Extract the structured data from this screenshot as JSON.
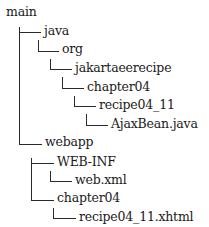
{
  "tree": {
    "root": "main",
    "nodes": [
      {
        "label": "java",
        "depth": 1
      },
      {
        "label": "org",
        "depth": 2
      },
      {
        "label": "jakartaeerecipe",
        "depth": 3
      },
      {
        "label": "chapter04",
        "depth": 4
      },
      {
        "label": "recipe04_11",
        "depth": 5
      },
      {
        "label": "AjaxBean.java",
        "depth": 6
      },
      {
        "label": "webapp",
        "depth": 1
      },
      {
        "label": "WEB-INF",
        "depth": 2
      },
      {
        "label": "web.xml",
        "depth": 3
      },
      {
        "label": "chapter04",
        "depth": 2
      },
      {
        "label": "recipe04_11.xhtml",
        "depth": 3
      }
    ]
  }
}
